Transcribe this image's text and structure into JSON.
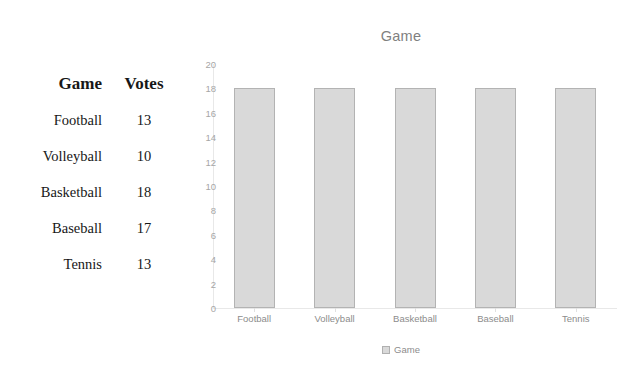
{
  "table": {
    "headers": [
      "Game",
      "Votes"
    ],
    "rows": [
      {
        "game": "Football",
        "votes": "13"
      },
      {
        "game": "Volleyball",
        "votes": "10"
      },
      {
        "game": "Basketball",
        "votes": "18"
      },
      {
        "game": "Baseball",
        "votes": "17"
      },
      {
        "game": "Tennis",
        "votes": "13"
      }
    ]
  },
  "legend": {
    "label": "Game",
    "swatch_name": "legend-swatch-game"
  },
  "colors": {
    "bar_fill": "#d9d9d9",
    "bar_stroke": "#b3b3b3",
    "axis": "#e8e8e8",
    "tick_text": "#a6a6a6",
    "category_text": "#8c8c8c",
    "title_text": "#7f7f7f",
    "table_text": "#171717",
    "background": "#ffffff"
  },
  "chart_data": {
    "type": "bar",
    "title": "Game",
    "xlabel": "",
    "ylabel": "",
    "categories": [
      "Football",
      "Volleyball",
      "Basketball",
      "Baseball",
      "Tennis"
    ],
    "values": [
      18,
      18,
      18,
      18,
      18
    ],
    "series": [
      {
        "name": "Game",
        "values": [
          18,
          18,
          18,
          18,
          18
        ]
      }
    ],
    "ylim": [
      0,
      20
    ],
    "ytick_step": 2,
    "yticks": [
      0,
      2,
      4,
      6,
      8,
      10,
      12,
      14,
      16,
      18,
      20
    ],
    "ytick_labels": [
      "0",
      "2",
      "4",
      "6",
      "8",
      "10",
      "12",
      "14",
      "16",
      "18",
      "20"
    ],
    "grid": false,
    "legend": [
      "Game"
    ],
    "legend_position": "bottom"
  }
}
